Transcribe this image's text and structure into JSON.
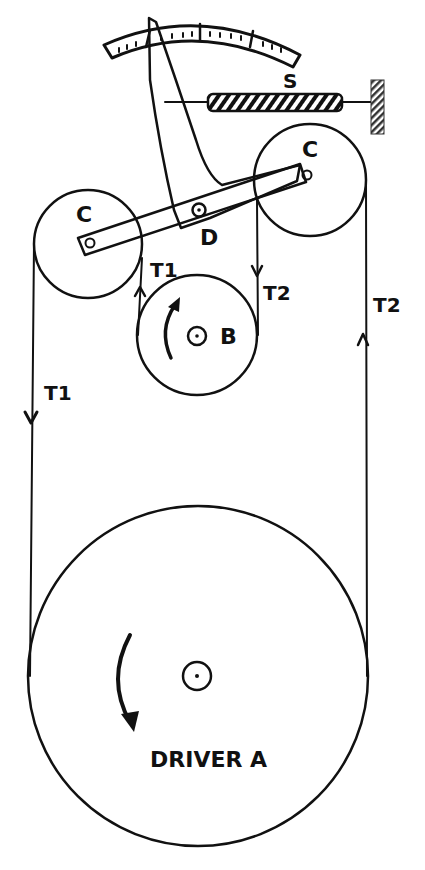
{
  "diagram": {
    "type": "belt-tension-dynamometer",
    "colors": {
      "ink": "#111111",
      "paper": "#ffffff"
    },
    "components": {
      "driver": {
        "label": "DRIVER A",
        "rotation": "counterclockwise"
      },
      "pulley_b": {
        "label": "B",
        "rotation": "clockwise"
      },
      "jockey_left": {
        "label": "C"
      },
      "jockey_right": {
        "label": "C"
      },
      "pivot": {
        "label": "D"
      },
      "spring": {
        "label": "S"
      },
      "scale": {
        "major_divisions": 4,
        "minor_ticks_per_division": 4
      }
    },
    "tensions": {
      "left_outer": "T1",
      "left_inner": "T1",
      "right_inner": "T2",
      "right_outer": "T2"
    }
  }
}
